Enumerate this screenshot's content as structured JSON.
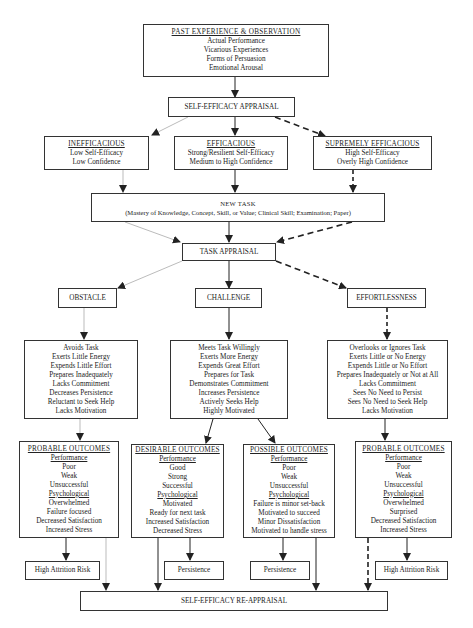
{
  "past_experience": {
    "title": "PAST EXPERIENCE & OBSERVATION",
    "items": [
      "Actual Performance",
      "Vicarious Experiences",
      "Forms of Persuasion",
      "Emotional Arousal"
    ]
  },
  "self_efficacy_appraisal": {
    "label": "SELF-EFFICACY APPRAISAL"
  },
  "efficacy_levels": [
    {
      "title": "INEFFICACIOUS",
      "items": [
        "Low Self-Efficacy",
        "Low Confidence"
      ]
    },
    {
      "title": "EFFICACIOUS",
      "items": [
        "Strong/Resilient Self-Efficacy",
        "Medium to High Confidence"
      ]
    },
    {
      "title": "SUPREMELY EFFICACIOUS",
      "items": [
        "High Self-Efficacy",
        "Overly High Confidence"
      ]
    }
  ],
  "new_task": {
    "title": "NEW TASK",
    "subtitle": "(Mastery of Knowledge, Concept, Skill, or Value; Clinical Skill; Examination; Paper)"
  },
  "task_appraisal": {
    "label": "TASK APPRAISAL"
  },
  "appraisal_types": [
    {
      "label": "OBSTACLE"
    },
    {
      "label": "CHALLENGE"
    },
    {
      "label": "EFFORTLESSNESS"
    }
  ],
  "behaviors": [
    {
      "items": [
        "Avoids Task",
        "Exerts Little Energy",
        "Expends Little Effort",
        "Prepares Inadequately",
        "Lacks Commitment",
        "Decreases Persistence",
        "Reluctant to Seek Help",
        "Lacks Motivation"
      ]
    },
    {
      "items": [
        "Meets Task Willingly",
        "Exerts More Energy",
        "Expends Great Effort",
        "Prepares for Task",
        "Demonstrates Commitment",
        "Increases Persistence",
        "Actively Seeks Help",
        "Highly Motivated"
      ]
    },
    {
      "items": [
        "Overlooks or Ignores Task",
        "Exerts Little or No Energy",
        "Expends Little or No Effort",
        "Prepares Inadequately or Not at All",
        "Lacks Commitment",
        "Sees No Need to Persist",
        "Sees No Need to Seek Help",
        "Lacks Motivation"
      ]
    }
  ],
  "outcomes": [
    {
      "title": "PROBABLE OUTCOMES",
      "performance_label": "Performance",
      "performance": [
        "Poor",
        "Weak",
        "Unsuccessful"
      ],
      "psychological_label": "Psychological",
      "psychological": [
        "Overwhelmed",
        "Failure focused",
        "Decreased Satisfaction",
        "Increased Stress"
      ]
    },
    {
      "title": "DESIRABLE OUTCOMES",
      "performance_label": "Performance",
      "performance": [
        "Good",
        "Strong",
        "Successful"
      ],
      "psychological_label": "Psychological",
      "psychological": [
        "Motivated",
        "Ready for next task",
        "Increased Satisfaction",
        "Decreased Stress"
      ]
    },
    {
      "title": "POSSIBLE OUTCOMES",
      "performance_label": "Performance",
      "performance": [
        "Poor",
        "Weak",
        "Unsuccessful"
      ],
      "psychological_label": "Psychological",
      "psychological": [
        "Failure is minor set-back",
        "Motivated to succeed",
        "Minor Dissatisfaction",
        "Motivated to handle stress"
      ]
    },
    {
      "title": "PROBABLE OUTCOMES",
      "performance_label": "Performance",
      "performance": [
        "Poor",
        "Weak",
        "Unsuccessful"
      ],
      "psychological_label": "Psychological",
      "psychological": [
        "Overwhelmed",
        "Surprised",
        "Decreased Satisfaction",
        "Increased Stress"
      ]
    }
  ],
  "results": [
    {
      "label": "High Attrition Risk"
    },
    {
      "label": "Persistence"
    },
    {
      "label": "Persistence"
    },
    {
      "label": "High Attrition Risk"
    }
  ],
  "re_appraisal": {
    "label": "SELF-EFFICACY RE-APPRAISAL"
  },
  "colors": {
    "line": "#333333",
    "faint_line": "#999999",
    "text": "#222222",
    "background": "#ffffff"
  }
}
